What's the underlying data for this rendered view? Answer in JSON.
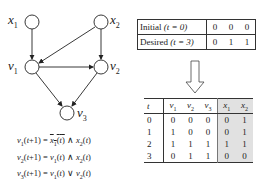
{
  "graph": {
    "nodes": [
      {
        "id": "x1",
        "label_base": "x",
        "label_sub": "1",
        "cx": 32,
        "cy": 22
      },
      {
        "id": "x2",
        "label_base": "x",
        "label_sub": "2",
        "cx": 101,
        "cy": 22
      },
      {
        "id": "v1",
        "label_base": "v",
        "label_sub": "1",
        "cx": 32,
        "cy": 67
      },
      {
        "id": "v2",
        "label_base": "v",
        "label_sub": "2",
        "cx": 101,
        "cy": 67
      },
      {
        "id": "v3",
        "label_base": "v",
        "label_sub": "3",
        "cx": 67,
        "cy": 113
      }
    ],
    "edges": [
      {
        "from": "x1",
        "to": "v1"
      },
      {
        "from": "x2",
        "to": "v1"
      },
      {
        "from": "x2",
        "to": "v2"
      },
      {
        "from": "v1",
        "to": "v2"
      },
      {
        "from": "v1",
        "to": "v3"
      },
      {
        "from": "v2",
        "to": "v3"
      }
    ]
  },
  "equations": [
    {
      "lhs": "v1(t+1)",
      "rhs": "NOT x1(t) AND x2(t)"
    },
    {
      "lhs": "v2(t+1)",
      "rhs": "v1(t) AND x2(t)"
    },
    {
      "lhs": "v3(t+1)",
      "rhs": "v1(t) OR v2(t)"
    }
  ],
  "state_table": {
    "rows": [
      {
        "label": "Initial",
        "time": "(t = 0)",
        "values": [
          "0",
          "0",
          "0"
        ]
      },
      {
        "label": "Desired",
        "time": "(t = 3)",
        "values": [
          "0",
          "1",
          "1"
        ]
      }
    ]
  },
  "trajectory_table": {
    "headers": [
      "t",
      "v1",
      "v2",
      "v3",
      "x1",
      "x2"
    ],
    "rows": [
      [
        "0",
        "0",
        "0",
        "0",
        "0",
        "1"
      ],
      [
        "1",
        "1",
        "0",
        "0",
        "0",
        "1"
      ],
      [
        "2",
        "1",
        "1",
        "1",
        "1",
        "1"
      ],
      [
        "3",
        "0",
        "1",
        "1",
        "0",
        "0"
      ]
    ],
    "shade_color": "#e1e1e1"
  }
}
